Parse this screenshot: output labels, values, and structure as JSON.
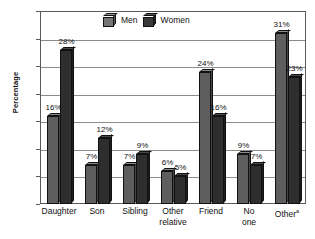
{
  "chart_data": {
    "type": "bar",
    "title": "",
    "subtitle": "",
    "xlabel": "",
    "ylabel": "Percentage",
    "ylim": [
      0,
      35
    ],
    "ytick_step": 5,
    "yticks": [
      0,
      5,
      10,
      15,
      20,
      25,
      30,
      35
    ],
    "ytick_labels": [
      "0",
      "5",
      "10",
      "15",
      "20",
      "25",
      "30",
      "35"
    ],
    "grid": true,
    "grid_axis": "y",
    "legend_position": "top-center",
    "value_label_suffix": "%",
    "categories": [
      "Daughter",
      "Son",
      "Sibling",
      "Other relative",
      "Friend",
      "No one",
      "Other"
    ],
    "category_lines": [
      [
        "Daughter"
      ],
      [
        "Son"
      ],
      [
        "Sibling"
      ],
      [
        "Other",
        "relative"
      ],
      [
        "Friend"
      ],
      [
        "No",
        "one"
      ],
      [
        "Other"
      ]
    ],
    "category_footnote_markers": [
      "",
      "",
      "",
      "",
      "",
      "",
      "a"
    ],
    "series": [
      {
        "name": "Men",
        "color": "#5e5e5e",
        "values": [
          16,
          7,
          7,
          6,
          24,
          9,
          31
        ],
        "value_labels": [
          "16%",
          "7%",
          "7%",
          "6%",
          "24%",
          "9%",
          "31%"
        ]
      },
      {
        "name": "Women",
        "color": "#2e2e2e",
        "values": [
          28,
          12,
          9,
          5,
          16,
          7,
          23
        ],
        "value_labels": [
          "28%",
          "12%",
          "9%",
          "5%",
          "16%",
          "7%",
          "23%"
        ]
      }
    ]
  },
  "legend": {
    "items": [
      {
        "label": "Men",
        "key": "men"
      },
      {
        "label": "Women",
        "key": "women"
      }
    ]
  }
}
